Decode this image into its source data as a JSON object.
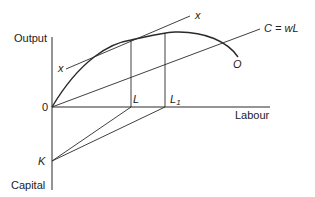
{
  "diagram": {
    "axes": {
      "y_top_label": "Output",
      "y_bottom_label": "Capital",
      "x_label": "Labour",
      "origin_label": "0"
    },
    "points": {
      "L": "L",
      "L1_base": "L",
      "L1_sub": "1",
      "K": "K",
      "O": "O"
    },
    "lines": {
      "tangent_label_left": "x",
      "tangent_label_right": "x",
      "cost_line_label": "C = wL"
    },
    "colors": {
      "line": "#2a2a2a",
      "text": "#222222",
      "background": "#ffffff"
    }
  }
}
